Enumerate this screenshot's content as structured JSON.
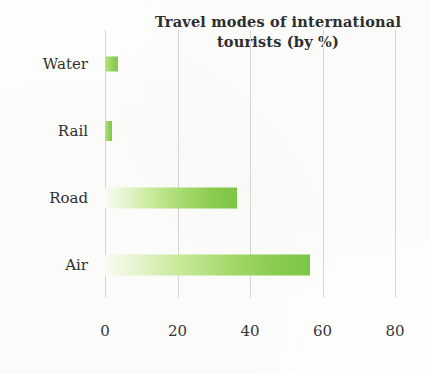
{
  "chart_data": {
    "type": "bar",
    "orientation": "horizontal",
    "title": "Travel modes of international tourists (by %)",
    "title_line_1": "Travel modes of international",
    "title_line_2": "tourists (by %)",
    "xlabel": "",
    "ylabel": "",
    "categories": [
      "Water",
      "Rail",
      "Road",
      "Air"
    ],
    "values": [
      3.5,
      2,
      36.5,
      56.5
    ],
    "xlim": [
      0,
      88.8
    ],
    "xticks": [
      0,
      20,
      40,
      60,
      80
    ],
    "xtick_labels": [
      "0",
      "20",
      "40",
      "60",
      "80"
    ],
    "grid": "vertical",
    "legend": "none",
    "bar_color_light": "#e8f7d0",
    "bar_color_dark": "#7fc845",
    "gridline_color": "#d9d9d9",
    "text_color": "#303032",
    "background_color": "#fefefc",
    "bars": [
      {
        "label": "Water",
        "value": 3.5
      },
      {
        "label": "Rail",
        "value": 2
      },
      {
        "label": "Road",
        "value": 36.5
      },
      {
        "label": "Air",
        "value": 56.5
      }
    ]
  }
}
